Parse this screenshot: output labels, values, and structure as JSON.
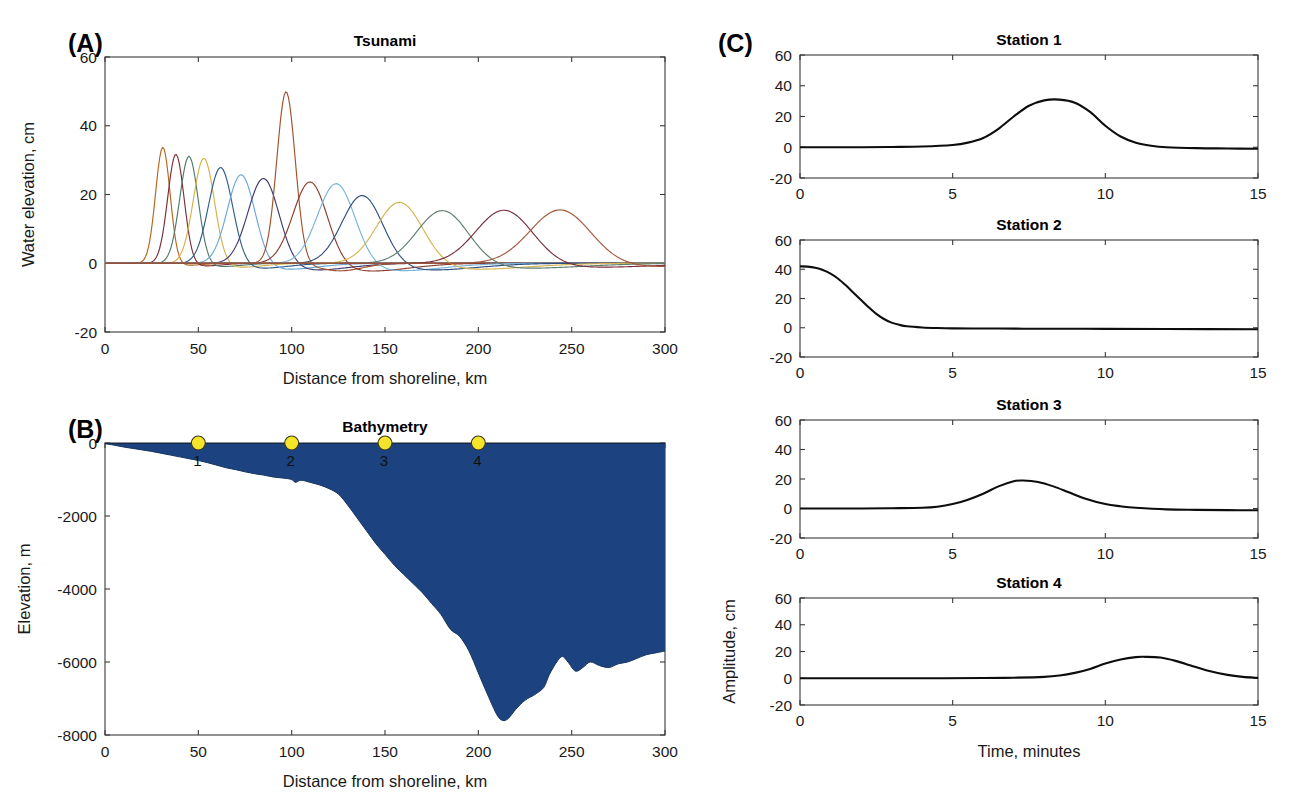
{
  "figure": {
    "width": 1303,
    "height": 800,
    "background": "#ffffff"
  },
  "panels": {
    "a": {
      "letter": "(A)",
      "title": "Tsunami",
      "xlabel": "Distance from shoreline, km",
      "ylabel": "Water elevation, cm"
    },
    "b": {
      "letter": "(B)",
      "title": "Bathymetry",
      "xlabel": "Distance from shoreline, km",
      "ylabel": "Elevation, m"
    },
    "c": {
      "letter": "(C)",
      "xlabel": "Time, minutes",
      "ylabel": "Amplitude, cm",
      "titles": [
        "Station 1",
        "Station 2",
        "Station 3",
        "Station 4"
      ]
    }
  },
  "colors": {
    "ocean_fill": "#1c4380",
    "ocean_edge": "#16355f",
    "marker_fill": "#f6e42a",
    "marker_edge": "#3f3f28",
    "trace": "#0d0d0d",
    "axis": "#3a3a3a",
    "text": "#1a1a1a"
  },
  "chart_data": [
    {
      "id": "panel-a-tsunami",
      "type": "line",
      "title": "Tsunami",
      "xlabel": "Distance from shoreline, km",
      "ylabel": "Water elevation, cm",
      "xlim": [
        0,
        300
      ],
      "ylim": [
        -20,
        60
      ],
      "xticks": [
        0,
        50,
        100,
        150,
        200,
        250,
        300
      ],
      "yticks": [
        -20,
        0,
        20,
        40,
        60
      ],
      "xtick_labels": [
        "0",
        "50",
        "100",
        "150",
        "200",
        "250",
        "300"
      ],
      "ytick_labels": [
        "-20",
        "0",
        "20",
        "40",
        "60"
      ],
      "grid": false,
      "legend": "none",
      "description": "Successive snapshots of a tsunami wave propagating toward shore; each colored curve is one time step. Waves steepen and narrow as they shoal toward the shoreline on the left.",
      "snapshots": [
        {
          "name": "t1",
          "color": "#b5651d",
          "peak_x": 31,
          "peak_y": 34,
          "width": 5.5,
          "trough_y": -0.6,
          "trough_offset": 12
        },
        {
          "name": "t2",
          "color": "#7b2d3a",
          "peak_x": 38,
          "peak_y": 32,
          "width": 6.2,
          "trough_y": -0.8,
          "trough_offset": 14
        },
        {
          "name": "t3",
          "color": "#4f7a6a",
          "peak_x": 45,
          "peak_y": 31.5,
          "width": 7.0,
          "trough_y": -1.0,
          "trough_offset": 16
        },
        {
          "name": "t4",
          "color": "#d8b04a",
          "peak_x": 53,
          "peak_y": 31,
          "width": 8.0,
          "trough_y": -1.2,
          "trough_offset": 18
        },
        {
          "name": "t5",
          "color": "#2e5c8a",
          "peak_x": 62,
          "peak_y": 28.5,
          "width": 9.2,
          "trough_y": -1.5,
          "trough_offset": 20
        },
        {
          "name": "t6",
          "color": "#6aa8d8",
          "peak_x": 73,
          "peak_y": 26.5,
          "width": 10.5,
          "trough_y": -1.8,
          "trough_offset": 23
        },
        {
          "name": "t7",
          "color": "#3e3b6e",
          "peak_x": 85,
          "peak_y": 25.5,
          "width": 11.8,
          "trough_y": -2.0,
          "trough_offset": 26
        },
        {
          "name": "t8",
          "color": "#a0522d",
          "peak_x": 97,
          "peak_y": 50,
          "width": 7.0,
          "trough_y": -2.2,
          "trough_offset": 29
        },
        {
          "name": "t9",
          "color": "#8c3b2e",
          "peak_x": 110,
          "peak_y": 24.5,
          "width": 13.0,
          "trough_y": -2.3,
          "trough_offset": 31
        },
        {
          "name": "t10",
          "color": "#77b5dd",
          "peak_x": 124,
          "peak_y": 24,
          "width": 14.2,
          "trough_y": -2.2,
          "trough_offset": 33
        },
        {
          "name": "t11",
          "color": "#2f4f7f",
          "peak_x": 138,
          "peak_y": 20.5,
          "width": 15.5,
          "trough_y": -2.0,
          "trough_offset": 35
        },
        {
          "name": "t12",
          "color": "#d6b34e",
          "peak_x": 158,
          "peak_y": 18.5,
          "width": 17.5,
          "trough_y": -1.8,
          "trough_offset": 38
        },
        {
          "name": "t13",
          "color": "#5d7f6b",
          "peak_x": 181,
          "peak_y": 16,
          "width": 19.5,
          "trough_y": -1.5,
          "trough_offset": 41
        },
        {
          "name": "t14",
          "color": "#7a2f3c",
          "peak_x": 214,
          "peak_y": 16,
          "width": 21.5,
          "trough_y": -1.2,
          "trough_offset": 44
        },
        {
          "name": "t15",
          "color": "#a4563a",
          "peak_x": 244,
          "peak_y": 16,
          "width": 23.0,
          "trough_y": -1.0,
          "trough_offset": 47
        }
      ]
    },
    {
      "id": "panel-b-bathymetry",
      "type": "area",
      "title": "Bathymetry",
      "xlabel": "Distance from shoreline, km",
      "ylabel": "Elevation, m",
      "xlim": [
        0,
        300
      ],
      "ylim": [
        -8000,
        0
      ],
      "xticks": [
        0,
        50,
        100,
        150,
        200,
        250,
        300
      ],
      "yticks": [
        -8000,
        -6000,
        -4000,
        -2000,
        0
      ],
      "xtick_labels": [
        "0",
        "50",
        "100",
        "150",
        "200",
        "250",
        "300"
      ],
      "ytick_labels": [
        "-8000",
        "-6000",
        "-4000",
        "-2000",
        "0"
      ],
      "grid": false,
      "fill_color": "#1c4380",
      "description": "Seafloor depth profile from the shoreline out to 300 km, filled with ocean water. Gentle shelf to ~130 km, steep continental slope, trench minimum near -7600 m at ~213 km.",
      "x": [
        0,
        5,
        10,
        15,
        20,
        25,
        30,
        35,
        40,
        45,
        50,
        55,
        60,
        65,
        70,
        75,
        80,
        85,
        90,
        95,
        100,
        102,
        105,
        110,
        115,
        120,
        125,
        130,
        135,
        140,
        145,
        150,
        155,
        160,
        165,
        170,
        175,
        180,
        185,
        190,
        195,
        200,
        205,
        210,
        213,
        216,
        220,
        225,
        230,
        235,
        238,
        242,
        245,
        248,
        252,
        256,
        260,
        265,
        270,
        275,
        280,
        285,
        290,
        295,
        300
      ],
      "elevation": [
        -20,
        -60,
        -110,
        -150,
        -190,
        -230,
        -280,
        -330,
        -380,
        -430,
        -480,
        -540,
        -610,
        -680,
        -730,
        -790,
        -840,
        -880,
        -930,
        -960,
        -1000,
        -1080,
        -1020,
        -1080,
        -1150,
        -1250,
        -1400,
        -1700,
        -2050,
        -2400,
        -2750,
        -3050,
        -3350,
        -3600,
        -3850,
        -4100,
        -4400,
        -4700,
        -5100,
        -5300,
        -5700,
        -6300,
        -6900,
        -7450,
        -7600,
        -7550,
        -7300,
        -7050,
        -6900,
        -6700,
        -6350,
        -6000,
        -5850,
        -6000,
        -6250,
        -6150,
        -6000,
        -6100,
        -6150,
        -6050,
        -6000,
        -5900,
        -5800,
        -5750,
        -5700
      ],
      "stations": [
        {
          "label": "1",
          "x": 50,
          "y": 0
        },
        {
          "label": "2",
          "x": 100,
          "y": 0
        },
        {
          "label": "3",
          "x": 150,
          "y": 0
        },
        {
          "label": "4",
          "x": 200,
          "y": 0
        }
      ]
    },
    {
      "id": "panel-c-station-1",
      "type": "line",
      "title": "Station 1",
      "xlabel": "Time, minutes",
      "ylabel": "Amplitude, cm",
      "xlim": [
        0,
        15
      ],
      "ylim": [
        -20,
        60
      ],
      "xticks": [
        0,
        5,
        10,
        15
      ],
      "yticks": [
        -20,
        0,
        20,
        40,
        60
      ],
      "xtick_labels": [
        "0",
        "5",
        "10",
        "15"
      ],
      "ytick_labels": [
        "-20",
        "0",
        "20",
        "40",
        "60"
      ],
      "grid": false,
      "description": "Wave arrives late with a single broad crest peaking near 31 cm at about 8.5 minutes.",
      "peak_time": 8.5,
      "peak_amplitude": 31,
      "pulse_width": 1.6,
      "baseline_start": 0,
      "baseline_end": -1,
      "t": [
        0,
        1,
        2,
        3,
        4,
        5,
        5.5,
        6,
        6.5,
        7,
        7.5,
        8,
        8.5,
        9,
        9.5,
        10,
        10.5,
        11,
        11.5,
        12,
        13,
        14,
        15
      ],
      "amplitude": [
        0,
        0,
        0,
        0.2,
        0.5,
        1.5,
        3,
        6,
        12,
        20,
        27,
        30.5,
        31,
        29,
        23,
        14,
        7,
        3,
        1,
        0,
        -0.6,
        -0.8,
        -1
      ]
    },
    {
      "id": "panel-c-station-2",
      "type": "line",
      "title": "Station 2",
      "xlabel": "Time, minutes",
      "ylabel": "Amplitude, cm",
      "xlim": [
        0,
        15
      ],
      "ylim": [
        -20,
        60
      ],
      "xticks": [
        0,
        5,
        10,
        15
      ],
      "yticks": [
        -20,
        0,
        20,
        40,
        60
      ],
      "xtick_labels": [
        "0",
        "5",
        "10",
        "15"
      ],
      "ytick_labels": [
        "-20",
        "0",
        "20",
        "40",
        "60"
      ],
      "grid": false,
      "description": "Source location: starts at about 42 cm at t = 0 and decays monotonically to near zero by 4 minutes.",
      "peak_time": 0,
      "peak_amplitude": 42,
      "baseline_start": 42,
      "baseline_end": -1,
      "t": [
        0,
        0.25,
        0.5,
        0.75,
        1,
        1.25,
        1.5,
        1.75,
        2,
        2.25,
        2.5,
        2.75,
        3,
        3.25,
        3.5,
        4,
        4.5,
        5,
        6,
        7,
        8,
        9,
        10,
        12,
        15
      ],
      "amplitude": [
        42,
        41.8,
        41,
        39.5,
        37,
        33.5,
        29,
        24,
        19,
        14,
        9.5,
        6,
        3.5,
        2,
        1,
        0.2,
        -0.2,
        -0.4,
        -0.5,
        -0.6,
        -0.7,
        -0.7,
        -0.8,
        -0.9,
        -1
      ]
    },
    {
      "id": "panel-c-station-3",
      "type": "line",
      "title": "Station 3",
      "xlabel": "Time, minutes",
      "ylabel": "Amplitude, cm",
      "xlim": [
        0,
        15
      ],
      "ylim": [
        -20,
        60
      ],
      "xticks": [
        0,
        5,
        10,
        15
      ],
      "yticks": [
        -20,
        0,
        20,
        40,
        60
      ],
      "xtick_labels": [
        "0",
        "5",
        "10",
        "15"
      ],
      "ytick_labels": [
        "-20",
        "0",
        "20",
        "40",
        "60"
      ],
      "grid": false,
      "description": "Single crest peaking near 19 cm at about 7.3 minutes, broader and lower than Station 1.",
      "peak_time": 7.3,
      "peak_amplitude": 19,
      "pulse_width": 1.5,
      "baseline_start": 0,
      "baseline_end": -1.2,
      "t": [
        0,
        1,
        2,
        3,
        4,
        4.5,
        5,
        5.5,
        6,
        6.5,
        7,
        7.3,
        7.8,
        8.3,
        8.8,
        9.3,
        10,
        10.5,
        11,
        12,
        13,
        14,
        15
      ],
      "amplitude": [
        0,
        0,
        0,
        0.2,
        0.5,
        1.2,
        3,
        6,
        10,
        15,
        18.5,
        19,
        18,
        15,
        11,
        7,
        3,
        1.5,
        0.5,
        -0.6,
        -0.9,
        -1.1,
        -1.2
      ]
    },
    {
      "id": "panel-c-station-4",
      "type": "line",
      "title": "Station 4",
      "xlabel": "Time, minutes",
      "ylabel": "Amplitude, cm",
      "xlim": [
        0,
        15
      ],
      "ylim": [
        -20,
        60
      ],
      "xticks": [
        0,
        5,
        10,
        15
      ],
      "yticks": [
        -20,
        0,
        20,
        40,
        60
      ],
      "xtick_labels": [
        "0",
        "5",
        "10",
        "15"
      ],
      "ytick_labels": [
        "-20",
        "0",
        "20",
        "40",
        "60"
      ],
      "grid": false,
      "description": "Latest arrival: broad low crest peaking near 16 cm at about 11.3 minutes.",
      "peak_time": 11.3,
      "peak_amplitude": 16,
      "pulse_width": 1.4,
      "baseline_start": 0,
      "baseline_end": 0,
      "t": [
        0,
        2,
        4,
        6,
        7,
        8,
        8.5,
        9,
        9.5,
        10,
        10.5,
        11,
        11.3,
        11.8,
        12.3,
        12.8,
        13.3,
        14,
        14.5,
        15
      ],
      "amplitude": [
        0,
        0,
        0,
        0.2,
        0.4,
        1,
        2,
        4,
        7,
        11,
        14,
        15.8,
        16,
        15.5,
        13,
        9.5,
        6,
        2.5,
        1,
        0.3
      ]
    }
  ]
}
